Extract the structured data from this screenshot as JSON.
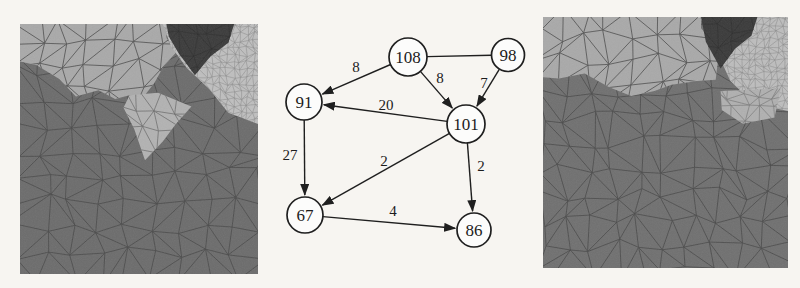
{
  "figure": {
    "background": "#f7f5f1",
    "panels": {
      "left": {
        "name": "left-mesh-image",
        "x": 20,
        "y": 24,
        "w": 238,
        "h": 250,
        "seed": 7,
        "grain": 0.09,
        "base": {
          "name": "main-dark-region",
          "fill": "#6c6c6c",
          "line": "#4b4b4b",
          "cell": 26,
          "lw": 1.0
        },
        "regions": [
          {
            "name": "upper-light-region",
            "fill": "#a9a9a9",
            "line": "#565656",
            "cell": 23,
            "lw": 1.0,
            "pts": [
              [
                0,
                0
              ],
              [
                0.62,
                0
              ],
              [
                0.615,
                0.055
              ],
              [
                0.655,
                0.115
              ],
              [
                0.6,
                0.175
              ],
              [
                0.565,
                0.235
              ],
              [
                0.52,
                0.29
              ],
              [
                0.46,
                0.285
              ],
              [
                0.4,
                0.3
              ],
              [
                0.33,
                0.265
              ],
              [
                0.235,
                0.29
              ],
              [
                0.165,
                0.22
              ],
              [
                0.07,
                0.165
              ],
              [
                0,
                0.15
              ]
            ]
          },
          {
            "name": "center-light-patch",
            "fill": "#b2b2b2",
            "line": "#6f6f6f",
            "cell": 21,
            "lw": 0.9,
            "pts": [
              [
                0.46,
                0.285
              ],
              [
                0.58,
                0.275
              ],
              [
                0.72,
                0.33
              ],
              [
                0.655,
                0.4
              ],
              [
                0.6,
                0.47
              ],
              [
                0.525,
                0.545
              ],
              [
                0.48,
                0.42
              ],
              [
                0.435,
                0.335
              ]
            ]
          },
          {
            "name": "fine-mesh-region",
            "fill": "#bfbfbf",
            "line": "#8c8c8c",
            "cell": 7,
            "lw": 0.6,
            "pts": [
              [
                0.6,
                0
              ],
              [
                1,
                0
              ],
              [
                1,
                0.4
              ],
              [
                0.875,
                0.355
              ],
              [
                0.795,
                0.26
              ],
              [
                0.7,
                0.175
              ],
              [
                0.635,
                0.09
              ]
            ]
          },
          {
            "name": "dark-patch",
            "fill": "#3b3b3b",
            "line": "#2f2f2f",
            "cell": 17,
            "lw": 0.8,
            "pts": [
              [
                0.615,
                0
              ],
              [
                0.9,
                0
              ],
              [
                0.875,
                0.075
              ],
              [
                0.8,
                0.13
              ],
              [
                0.735,
                0.205
              ],
              [
                0.665,
                0.115
              ],
              [
                0.625,
                0.05
              ]
            ]
          }
        ]
      },
      "right": {
        "name": "right-mesh-image",
        "x": 543,
        "y": 17,
        "w": 245,
        "h": 251,
        "seed": 13,
        "grain": 0.09,
        "base": {
          "name": "main-dark-region",
          "fill": "#707070",
          "line": "#4b4b4b",
          "cell": 26,
          "lw": 1.0
        },
        "regions": [
          {
            "name": "upper-light-region",
            "fill": "#a9a9a9",
            "line": "#565656",
            "cell": 23,
            "lw": 1.0,
            "pts": [
              [
                0,
                0
              ],
              [
                0.645,
                0
              ],
              [
                0.645,
                0.045
              ],
              [
                0.69,
                0.095
              ],
              [
                0.715,
                0.165
              ],
              [
                0.705,
                0.25
              ],
              [
                0.63,
                0.255
              ],
              [
                0.525,
                0.27
              ],
              [
                0.455,
                0.295
              ],
              [
                0.36,
                0.315
              ],
              [
                0.27,
                0.28
              ],
              [
                0.17,
                0.225
              ],
              [
                0.065,
                0.245
              ],
              [
                0,
                0.24
              ]
            ]
          },
          {
            "name": "fine-mesh-region",
            "fill": "#bdbdbd",
            "line": "#8c8c8c",
            "cell": 7,
            "lw": 0.6,
            "pts": [
              [
                0.63,
                0
              ],
              [
                1,
                0
              ],
              [
                1,
                0.375
              ],
              [
                0.86,
                0.345
              ],
              [
                0.765,
                0.255
              ],
              [
                0.715,
                0.15
              ],
              [
                0.7,
                0.06
              ]
            ]
          },
          {
            "name": "right-light-patch",
            "fill": "#b0b0b0",
            "line": "#7a7a7a",
            "cell": 14,
            "lw": 0.8,
            "pts": [
              [
                0.725,
                0.295
              ],
              [
                0.97,
                0.285
              ],
              [
                0.945,
                0.4
              ],
              [
                0.815,
                0.425
              ],
              [
                0.73,
                0.37
              ]
            ]
          },
          {
            "name": "dark-patch",
            "fill": "#3a3a3a",
            "line": "#2f2f2f",
            "cell": 17,
            "lw": 0.8,
            "pts": [
              [
                0.645,
                0
              ],
              [
                0.875,
                0
              ],
              [
                0.85,
                0.075
              ],
              [
                0.785,
                0.125
              ],
              [
                0.725,
                0.205
              ],
              [
                0.665,
                0.1
              ]
            ]
          }
        ]
      }
    },
    "chart_data": {
      "type": "graph",
      "title": "",
      "nodes": [
        "108",
        "98",
        "91",
        "101",
        "67",
        "86"
      ],
      "edges": [
        {
          "from": "108",
          "to": "98",
          "weight": null
        },
        {
          "from": "108",
          "to": "91",
          "weight": 8
        },
        {
          "from": "108",
          "to": "101",
          "weight": 8
        },
        {
          "from": "98",
          "to": "101",
          "weight": 7
        },
        {
          "from": "101",
          "to": "91",
          "weight": 20
        },
        {
          "from": "91",
          "to": "67",
          "weight": 27
        },
        {
          "from": "101",
          "to": "67",
          "weight": 2
        },
        {
          "from": "101",
          "to": "86",
          "weight": 2
        },
        {
          "from": "67",
          "to": "86",
          "weight": 4
        }
      ]
    },
    "graph": {
      "stroke": "#1f1f1f",
      "node_fill": "#fcfcfb",
      "nodes": [
        {
          "id": "108",
          "x": 408,
          "y": 57,
          "r": 19
        },
        {
          "id": "98",
          "x": 508,
          "y": 55,
          "r": 16.5
        },
        {
          "id": "91",
          "x": 304,
          "y": 102,
          "r": 18
        },
        {
          "id": "101",
          "x": 466,
          "y": 124,
          "r": 19
        },
        {
          "id": "67",
          "x": 305,
          "y": 215,
          "r": 18
        },
        {
          "id": "86",
          "x": 474,
          "y": 230,
          "r": 17
        }
      ],
      "edges": [
        {
          "from": "108",
          "to": "98",
          "directed": false,
          "label": ""
        },
        {
          "from": "108",
          "to": "91",
          "directed": true,
          "label": "8",
          "lx": 356,
          "ly": 67
        },
        {
          "from": "108",
          "to": "101",
          "directed": true,
          "label": "8",
          "lx": 440,
          "ly": 78
        },
        {
          "from": "98",
          "to": "101",
          "directed": true,
          "label": "7",
          "lx": 484,
          "ly": 83
        },
        {
          "from": "101",
          "to": "91",
          "directed": true,
          "label": "20",
          "lx": 386,
          "ly": 105
        },
        {
          "from": "91",
          "to": "67",
          "directed": true,
          "label": "27",
          "lx": 290,
          "ly": 155
        },
        {
          "from": "101",
          "to": "67",
          "directed": true,
          "label": "2",
          "lx": 384,
          "ly": 161
        },
        {
          "from": "101",
          "to": "86",
          "directed": true,
          "label": "2",
          "lx": 481,
          "ly": 166
        },
        {
          "from": "67",
          "to": "86",
          "directed": true,
          "label": "4",
          "lx": 393,
          "ly": 211
        }
      ]
    }
  }
}
